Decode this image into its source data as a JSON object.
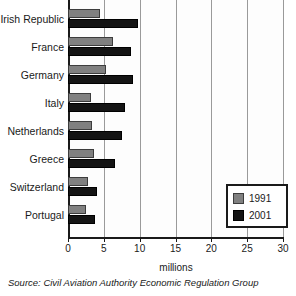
{
  "chart_data": {
    "type": "bar",
    "orientation": "horizontal",
    "title": "",
    "xlabel": "millions",
    "ylabel": "",
    "xlim": [
      0,
      30
    ],
    "xticks": [
      0,
      5,
      10,
      15,
      20,
      25,
      30
    ],
    "grid": true,
    "legend_position": "bottom-right",
    "categories": [
      "of America",
      "Irish Republic",
      "France",
      "Germany",
      "Italy",
      "Netherlands",
      "Greece",
      "Switzerland",
      "Portugal"
    ],
    "series": [
      {
        "name": "1991",
        "color": "#808080",
        "values": [
          null,
          4.5,
          6.3,
          5.3,
          3.2,
          3.4,
          3.6,
          2.8,
          2.5
        ]
      },
      {
        "name": "2001",
        "color": "#141414",
        "values": [
          null,
          9.7,
          8.8,
          9.0,
          8.0,
          7.5,
          6.5,
          4.0,
          3.8
        ]
      }
    ],
    "source": "Source: Civil Aviation Authority Economic Regulation Group"
  },
  "axis": {
    "x_title": "millions",
    "tick_labels": [
      "0",
      "5",
      "10",
      "15",
      "20",
      "25",
      "30"
    ]
  },
  "legend": {
    "items": [
      {
        "label": "1991",
        "swatch": "gray-square-swatch"
      },
      {
        "label": "2001",
        "swatch": "black-square-swatch"
      }
    ]
  },
  "footer": {
    "source": "Source: Civil Aviation Authority Economic Regulation Group"
  }
}
